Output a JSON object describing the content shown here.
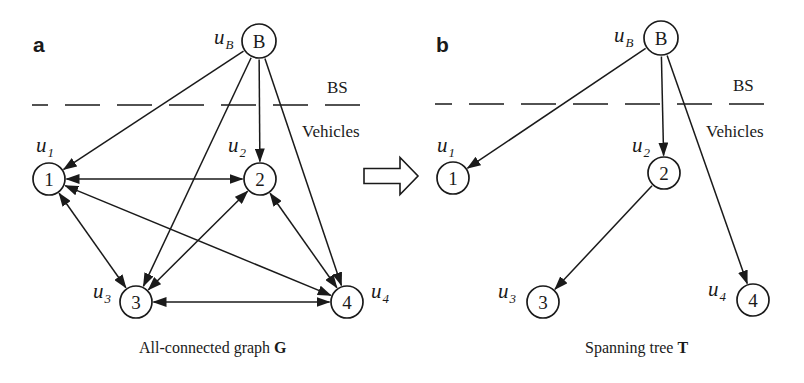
{
  "figure": {
    "width": 804,
    "height": 383,
    "stroke_color": "#1a1a1a",
    "background": "#ffffff",
    "transition_arrow": {
      "icon": "hollow-right-arrow-icon",
      "x1": 364,
      "x2": 418,
      "head_x": 400,
      "cy": 176,
      "shaft_half": 7.5,
      "head_half": 18.5
    }
  },
  "panels": [
    {
      "id": "a",
      "letter": "a",
      "letter_pos": [
        33,
        52
      ],
      "caption": {
        "text": "All-connected graph ",
        "bold": "G",
        "x": 139,
        "y": 353
      },
      "boundary": {
        "y": 105,
        "x_start": 32,
        "x_end": 365,
        "dash": "35 17",
        "dash_offset": 19,
        "upper_label": {
          "text": "BS",
          "x": 327,
          "y": 93
        },
        "lower_label": {
          "text": "Vehicles",
          "x": 302,
          "y": 137
        }
      },
      "nodes": [
        {
          "id": "B",
          "label": "B",
          "var": "u",
          "sub": "B",
          "cx": 259,
          "cy": 41,
          "r": 17,
          "var_x": 214,
          "var_y": 44
        },
        {
          "id": "1",
          "label": "1",
          "var": "u",
          "sub": "1",
          "cx": 49,
          "cy": 179,
          "r": 16,
          "var_x": 36,
          "var_y": 152
        },
        {
          "id": "2",
          "label": "2",
          "var": "u",
          "sub": "2",
          "cx": 260,
          "cy": 179,
          "r": 16,
          "var_x": 228,
          "var_y": 152
        },
        {
          "id": "3",
          "label": "3",
          "var": "u",
          "sub": "3",
          "cx": 136,
          "cy": 302,
          "r": 16,
          "var_x": 93,
          "var_y": 298
        },
        {
          "id": "4",
          "label": "4",
          "var": "u",
          "sub": "4",
          "cx": 347,
          "cy": 302,
          "r": 16,
          "var_x": 371,
          "var_y": 298
        }
      ],
      "edges": [
        {
          "from": "B",
          "to": "1",
          "type": "directed"
        },
        {
          "from": "B",
          "to": "2",
          "type": "directed"
        },
        {
          "from": "B",
          "to": "3",
          "type": "directed"
        },
        {
          "from": "B",
          "to": "4",
          "type": "directed"
        },
        {
          "from": "1",
          "to": "2",
          "type": "bidirectional"
        },
        {
          "from": "1",
          "to": "3",
          "type": "bidirectional"
        },
        {
          "from": "1",
          "to": "4",
          "type": "bidirectional"
        },
        {
          "from": "2",
          "to": "3",
          "type": "bidirectional"
        },
        {
          "from": "2",
          "to": "4",
          "type": "bidirectional"
        },
        {
          "from": "3",
          "to": "4",
          "type": "bidirectional"
        }
      ]
    },
    {
      "id": "b",
      "letter": "b",
      "letter_pos": [
        436,
        52
      ],
      "caption": {
        "text": "Spanning tree ",
        "bold": "T",
        "x": 585,
        "y": 353
      },
      "boundary": {
        "y": 104,
        "x_start": 435,
        "x_end": 770,
        "dash": "35 17",
        "dash_offset": 18,
        "upper_label": {
          "text": "BS",
          "x": 733,
          "y": 91
        },
        "lower_label": {
          "text": "Vehicles",
          "x": 706,
          "y": 137
        }
      },
      "nodes": [
        {
          "id": "B",
          "label": "B",
          "var": "u",
          "sub": "B",
          "cx": 661,
          "cy": 38,
          "r": 17,
          "var_x": 614,
          "var_y": 42
        },
        {
          "id": "1",
          "label": "1",
          "var": "u",
          "sub": "1",
          "cx": 453,
          "cy": 178,
          "r": 16,
          "var_x": 437,
          "var_y": 152
        },
        {
          "id": "2",
          "label": "2",
          "var": "u",
          "sub": "2",
          "cx": 664,
          "cy": 173,
          "r": 16,
          "var_x": 632,
          "var_y": 152
        },
        {
          "id": "3",
          "label": "3",
          "var": "u",
          "sub": "3",
          "cx": 543,
          "cy": 302,
          "r": 16,
          "var_x": 498,
          "var_y": 298
        },
        {
          "id": "4",
          "label": "4",
          "var": "u",
          "sub": "4",
          "cx": 753,
          "cy": 300,
          "r": 16,
          "var_x": 708,
          "var_y": 296
        }
      ],
      "edges": [
        {
          "from": "B",
          "to": "1",
          "type": "directed"
        },
        {
          "from": "B",
          "to": "2",
          "type": "directed"
        },
        {
          "from": "B",
          "to": "4",
          "type": "directed"
        },
        {
          "from": "2",
          "to": "3",
          "type": "directed"
        }
      ]
    }
  ]
}
